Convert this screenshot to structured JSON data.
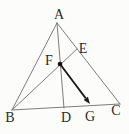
{
  "figure": {
    "background_color": "#fcfcfa",
    "line_color": "#6e6e6e",
    "arrow_color": "#1a1a1a",
    "dot_color": "#111111",
    "label_color": "#2b2b2b",
    "points": {
      "A": {
        "x": 57,
        "y": 23
      },
      "B": {
        "x": 12,
        "y": 110
      },
      "C": {
        "x": 120,
        "y": 104
      },
      "D": {
        "x": 64,
        "y": 108
      },
      "E": {
        "x": 77,
        "y": 49
      },
      "F": {
        "x": 60,
        "y": 64
      },
      "G": {
        "x": 90,
        "y": 104
      }
    },
    "segments": [
      {
        "id": "edge-AB",
        "from": "A",
        "to": "B",
        "kind": "edge"
      },
      {
        "id": "edge-BC",
        "from": "B",
        "to": "C",
        "kind": "edge"
      },
      {
        "id": "edge-AC",
        "from": "A",
        "to": "C",
        "kind": "edge"
      },
      {
        "id": "cevian-AD",
        "from": "A",
        "to": "D",
        "kind": "cevian"
      },
      {
        "id": "cevian-BE",
        "from": "B",
        "to": "E",
        "kind": "cevian"
      }
    ],
    "dot": {
      "at": "F",
      "radius": 2.3
    },
    "arrow": {
      "from": "F",
      "to": "G",
      "head_length": 7,
      "head_width": 5.2
    },
    "labels": {
      "A": {
        "text": "A",
        "x": 59,
        "y": 19
      },
      "B": {
        "text": "B",
        "x": 10,
        "y": 122
      },
      "C": {
        "text": "C",
        "x": 116,
        "y": 115
      },
      "D": {
        "text": "D",
        "x": 66,
        "y": 122
      },
      "E": {
        "text": "E",
        "x": 83,
        "y": 53
      },
      "F": {
        "text": "F",
        "x": 49,
        "y": 65
      },
      "G": {
        "text": "G",
        "x": 90,
        "y": 121
      }
    }
  }
}
